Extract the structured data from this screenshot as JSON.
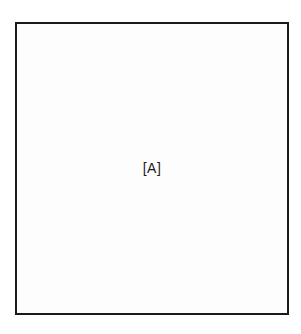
{
  "figure": {
    "panel_label": "[A]"
  }
}
